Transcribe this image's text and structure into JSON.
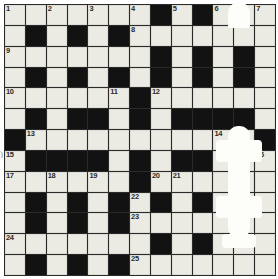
{
  "puzzle": {
    "title": "Crossword Grid",
    "type": "crossword",
    "columns": 13,
    "rows": 13,
    "edge_glyph": ")",
    "colors": {
      "white_cell": "#ebebe4",
      "black_cell": "#121212",
      "grid_line": "#2a2a2a",
      "number_text": "#2b2b2b",
      "page_background": "#ffffff",
      "cursor_overlay": "#fdfdfa"
    },
    "legend": {
      "white": "open letter cell",
      "black": "blocked cell"
    },
    "clue_numbers_present": [
      1,
      2,
      3,
      4,
      5,
      6,
      7,
      8,
      9,
      10,
      11,
      12,
      13,
      14,
      15,
      16,
      17,
      18,
      19,
      20,
      21,
      22,
      23,
      24,
      25
    ],
    "cells": [
      [
        {
          "t": "w",
          "n": "1"
        },
        {
          "t": "w",
          "n": ""
        },
        {
          "t": "w",
          "n": "2"
        },
        {
          "t": "w",
          "n": ""
        },
        {
          "t": "w",
          "n": "3"
        },
        {
          "t": "w",
          "n": ""
        },
        {
          "t": "w",
          "n": "4"
        },
        {
          "t": "b",
          "n": ""
        },
        {
          "t": "w",
          "n": "5"
        },
        {
          "t": "b",
          "n": ""
        },
        {
          "t": "w",
          "n": "6"
        },
        {
          "t": "w",
          "n": ""
        },
        {
          "t": "w",
          "n": "7"
        }
      ],
      [
        {
          "t": "w",
          "n": ""
        },
        {
          "t": "b",
          "n": ""
        },
        {
          "t": "w",
          "n": ""
        },
        {
          "t": "b",
          "n": ""
        },
        {
          "t": "w",
          "n": ""
        },
        {
          "t": "b",
          "n": ""
        },
        {
          "t": "w",
          "n": "8"
        },
        {
          "t": "w",
          "n": ""
        },
        {
          "t": "w",
          "n": ""
        },
        {
          "t": "w",
          "n": ""
        },
        {
          "t": "w",
          "n": ""
        },
        {
          "t": "w",
          "n": ""
        },
        {
          "t": "w",
          "n": ""
        }
      ],
      [
        {
          "t": "w",
          "n": "9"
        },
        {
          "t": "w",
          "n": ""
        },
        {
          "t": "w",
          "n": ""
        },
        {
          "t": "w",
          "n": ""
        },
        {
          "t": "w",
          "n": ""
        },
        {
          "t": "w",
          "n": ""
        },
        {
          "t": "w",
          "n": ""
        },
        {
          "t": "b",
          "n": ""
        },
        {
          "t": "w",
          "n": ""
        },
        {
          "t": "b",
          "n": ""
        },
        {
          "t": "w",
          "n": ""
        },
        {
          "t": "b",
          "n": ""
        },
        {
          "t": "w",
          "n": ""
        }
      ],
      [
        {
          "t": "w",
          "n": ""
        },
        {
          "t": "b",
          "n": ""
        },
        {
          "t": "w",
          "n": ""
        },
        {
          "t": "b",
          "n": ""
        },
        {
          "t": "w",
          "n": ""
        },
        {
          "t": "b",
          "n": ""
        },
        {
          "t": "w",
          "n": ""
        },
        {
          "t": "b",
          "n": ""
        },
        {
          "t": "w",
          "n": ""
        },
        {
          "t": "b",
          "n": ""
        },
        {
          "t": "w",
          "n": ""
        },
        {
          "t": "b",
          "n": ""
        },
        {
          "t": "w",
          "n": ""
        }
      ],
      [
        {
          "t": "w",
          "n": "10"
        },
        {
          "t": "w",
          "n": ""
        },
        {
          "t": "w",
          "n": ""
        },
        {
          "t": "w",
          "n": ""
        },
        {
          "t": "w",
          "n": ""
        },
        {
          "t": "w",
          "n": "11"
        },
        {
          "t": "b",
          "n": ""
        },
        {
          "t": "w",
          "n": "12"
        },
        {
          "t": "w",
          "n": ""
        },
        {
          "t": "w",
          "n": ""
        },
        {
          "t": "w",
          "n": ""
        },
        {
          "t": "w",
          "n": ""
        },
        {
          "t": "w",
          "n": ""
        }
      ],
      [
        {
          "t": "w",
          "n": ""
        },
        {
          "t": "b",
          "n": ""
        },
        {
          "t": "w",
          "n": ""
        },
        {
          "t": "b",
          "n": ""
        },
        {
          "t": "b",
          "n": ""
        },
        {
          "t": "w",
          "n": ""
        },
        {
          "t": "b",
          "n": ""
        },
        {
          "t": "w",
          "n": ""
        },
        {
          "t": "b",
          "n": ""
        },
        {
          "t": "b",
          "n": ""
        },
        {
          "t": "b",
          "n": ""
        },
        {
          "t": "b",
          "n": ""
        },
        {
          "t": "w",
          "n": ""
        }
      ],
      [
        {
          "t": "b",
          "n": ""
        },
        {
          "t": "w",
          "n": "13"
        },
        {
          "t": "w",
          "n": ""
        },
        {
          "t": "w",
          "n": ""
        },
        {
          "t": "w",
          "n": ""
        },
        {
          "t": "w",
          "n": ""
        },
        {
          "t": "w",
          "n": ""
        },
        {
          "t": "w",
          "n": ""
        },
        {
          "t": "w",
          "n": ""
        },
        {
          "t": "w",
          "n": ""
        },
        {
          "t": "w",
          "n": "14"
        },
        {
          "t": "w",
          "n": ""
        },
        {
          "t": "b",
          "n": ""
        }
      ],
      [
        {
          "t": "w",
          "n": "15"
        },
        {
          "t": "b",
          "n": ""
        },
        {
          "t": "b",
          "n": ""
        },
        {
          "t": "b",
          "n": ""
        },
        {
          "t": "b",
          "n": ""
        },
        {
          "t": "w",
          "n": ""
        },
        {
          "t": "b",
          "n": ""
        },
        {
          "t": "w",
          "n": ""
        },
        {
          "t": "b",
          "n": ""
        },
        {
          "t": "b",
          "n": ""
        },
        {
          "t": "w",
          "n": ""
        },
        {
          "t": "w",
          "n": ""
        },
        {
          "t": "w",
          "n": "16"
        }
      ],
      [
        {
          "t": "w",
          "n": "17"
        },
        {
          "t": "w",
          "n": ""
        },
        {
          "t": "w",
          "n": "18"
        },
        {
          "t": "w",
          "n": ""
        },
        {
          "t": "w",
          "n": "19"
        },
        {
          "t": "w",
          "n": ""
        },
        {
          "t": "b",
          "n": ""
        },
        {
          "t": "w",
          "n": "20"
        },
        {
          "t": "w",
          "n": "21"
        },
        {
          "t": "w",
          "n": ""
        },
        {
          "t": "w",
          "n": ""
        },
        {
          "t": "w",
          "n": ""
        },
        {
          "t": "w",
          "n": ""
        }
      ],
      [
        {
          "t": "w",
          "n": ""
        },
        {
          "t": "b",
          "n": ""
        },
        {
          "t": "w",
          "n": ""
        },
        {
          "t": "b",
          "n": ""
        },
        {
          "t": "w",
          "n": ""
        },
        {
          "t": "b",
          "n": ""
        },
        {
          "t": "w",
          "n": "22"
        },
        {
          "t": "b",
          "n": ""
        },
        {
          "t": "w",
          "n": ""
        },
        {
          "t": "b",
          "n": ""
        },
        {
          "t": "w",
          "n": ""
        },
        {
          "t": "w",
          "n": ""
        },
        {
          "t": "w",
          "n": ""
        }
      ],
      [
        {
          "t": "w",
          "n": ""
        },
        {
          "t": "b",
          "n": ""
        },
        {
          "t": "w",
          "n": ""
        },
        {
          "t": "b",
          "n": ""
        },
        {
          "t": "w",
          "n": ""
        },
        {
          "t": "b",
          "n": ""
        },
        {
          "t": "w",
          "n": "23"
        },
        {
          "t": "w",
          "n": ""
        },
        {
          "t": "w",
          "n": ""
        },
        {
          "t": "w",
          "n": ""
        },
        {
          "t": "w",
          "n": ""
        },
        {
          "t": "w",
          "n": ""
        },
        {
          "t": "w",
          "n": ""
        }
      ],
      [
        {
          "t": "w",
          "n": "24"
        },
        {
          "t": "w",
          "n": ""
        },
        {
          "t": "w",
          "n": ""
        },
        {
          "t": "w",
          "n": ""
        },
        {
          "t": "w",
          "n": ""
        },
        {
          "t": "w",
          "n": ""
        },
        {
          "t": "w",
          "n": ""
        },
        {
          "t": "b",
          "n": ""
        },
        {
          "t": "w",
          "n": ""
        },
        {
          "t": "b",
          "n": ""
        },
        {
          "t": "w",
          "n": ""
        },
        {
          "t": "w",
          "n": ""
        },
        {
          "t": "w",
          "n": ""
        }
      ],
      [
        {
          "t": "w",
          "n": ""
        },
        {
          "t": "b",
          "n": ""
        },
        {
          "t": "w",
          "n": ""
        },
        {
          "t": "b",
          "n": ""
        },
        {
          "t": "w",
          "n": ""
        },
        {
          "t": "b",
          "n": ""
        },
        {
          "t": "w",
          "n": "25"
        },
        {
          "t": "w",
          "n": ""
        },
        {
          "t": "w",
          "n": ""
        },
        {
          "t": "w",
          "n": ""
        },
        {
          "t": "w",
          "n": ""
        },
        {
          "t": "w",
          "n": ""
        },
        {
          "t": "w",
          "n": ""
        }
      ]
    ]
  }
}
